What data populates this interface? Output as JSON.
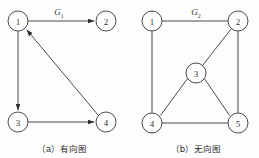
{
  "figure": {
    "panels": [
      {
        "id": "panel-a",
        "graph_label": "G",
        "graph_label_sub": "1",
        "caption": "（a）有向图",
        "caption_prefix": "（a）",
        "caption_text": "有向图",
        "type": "directed",
        "nodes": [
          {
            "id": "1",
            "label": "1",
            "cx": 18,
            "cy": 21,
            "r": 10
          },
          {
            "id": "2",
            "label": "2",
            "cx": 106,
            "cy": 21,
            "r": 10
          },
          {
            "id": "3",
            "label": "3",
            "cx": 18,
            "cy": 122,
            "r": 10
          },
          {
            "id": "4",
            "label": "4",
            "cx": 106,
            "cy": 122,
            "r": 10
          }
        ],
        "edges": [
          {
            "from": "1",
            "to": "2",
            "directed": true
          },
          {
            "from": "1",
            "to": "3",
            "directed": true
          },
          {
            "from": "3",
            "to": "4",
            "directed": true
          },
          {
            "from": "4",
            "to": "1",
            "directed": true
          }
        ],
        "label_pos": {
          "x": 59,
          "y": 14
        }
      },
      {
        "id": "panel-b",
        "graph_label": "G",
        "graph_label_sub": "2",
        "caption": "（b）无向图",
        "caption_prefix": "（b）",
        "caption_text": "无向图",
        "type": "undirected",
        "nodes": [
          {
            "id": "1",
            "label": "1",
            "cx": 152,
            "cy": 21,
            "r": 10
          },
          {
            "id": "2",
            "label": "2",
            "cx": 238,
            "cy": 21,
            "r": 10
          },
          {
            "id": "3",
            "label": "3",
            "cx": 196,
            "cy": 73,
            "r": 10
          },
          {
            "id": "4",
            "label": "4",
            "cx": 152,
            "cy": 123,
            "r": 10
          },
          {
            "id": "5",
            "label": "5",
            "cx": 238,
            "cy": 123,
            "r": 10
          }
        ],
        "edges": [
          {
            "from": "1",
            "to": "2",
            "directed": false
          },
          {
            "from": "1",
            "to": "4",
            "directed": false
          },
          {
            "from": "4",
            "to": "5",
            "directed": false
          },
          {
            "from": "2",
            "to": "5",
            "directed": false
          },
          {
            "from": "2",
            "to": "3",
            "directed": false
          },
          {
            "from": "3",
            "to": "4",
            "directed": false
          },
          {
            "from": "3",
            "to": "5",
            "directed": false
          }
        ],
        "label_pos": {
          "x": 196,
          "y": 14
        }
      }
    ],
    "caption_y": 150,
    "caption_a_x": 62,
    "caption_b_x": 196,
    "colors": {
      "stroke": "#4a4a4a",
      "arrow": "#2e2e2e",
      "node_fill": "#ffffff",
      "text": "#333333",
      "background": "#fdfdfd"
    }
  }
}
